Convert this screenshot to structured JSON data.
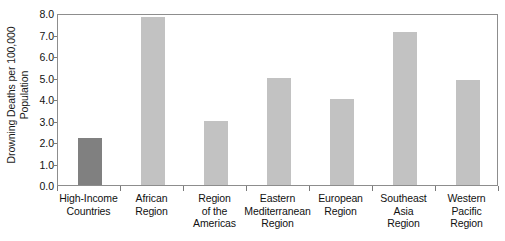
{
  "chart_data": {
    "type": "bar",
    "title": "",
    "xlabel": "",
    "ylabel": "Drowning Deaths per 100,000 Population",
    "ylabel_lines": [
      "Drowning Deaths per 100,000",
      "Population"
    ],
    "categories": [
      "High-Income Countries",
      "African Region",
      "Region of the Americas",
      "Eastern Mediterranean Region",
      "European Region",
      "Southeast Asia Region",
      "Western Pacific Region"
    ],
    "category_lines": [
      [
        "High-Income",
        "Countries"
      ],
      [
        "African",
        "Region"
      ],
      [
        "Region",
        "of the",
        "Americas"
      ],
      [
        "Eastern",
        "Mediterranean",
        "Region"
      ],
      [
        "European",
        "Region"
      ],
      [
        "Southeast",
        "Asia",
        "Region"
      ],
      [
        "Western",
        "Pacific",
        "Region"
      ]
    ],
    "values": [
      2.2,
      7.8,
      3.0,
      5.0,
      4.0,
      7.1,
      4.9
    ],
    "bar_colors": [
      "#808080",
      "#c2c2c2",
      "#c2c2c2",
      "#c2c2c2",
      "#c2c2c2",
      "#c2c2c2",
      "#c2c2c2"
    ],
    "ylim": [
      0.0,
      8.0
    ],
    "yticks": [
      0.0,
      1.0,
      2.0,
      3.0,
      4.0,
      5.0,
      6.0,
      7.0,
      8.0
    ],
    "ytick_labels": [
      "0.0",
      "1.0",
      "2.0",
      "3.0",
      "4.0",
      "5.0",
      "6.0",
      "7.0",
      "8.0"
    ],
    "grid": false,
    "legend": null,
    "frame_color": "#8d8d8d",
    "background": "#ffffff"
  }
}
